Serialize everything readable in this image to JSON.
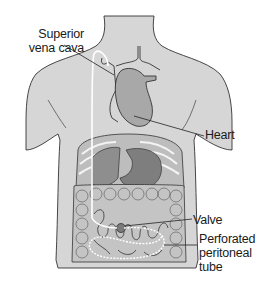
{
  "diagram": {
    "labels": {
      "superior_vena_cava": "Superior\nvena cava",
      "superior_vena_cava_line1": "Superior",
      "superior_vena_cava_line2": "vena cava",
      "heart": "Heart",
      "valve": "Valve",
      "tube_line1": "Perforated",
      "tube_line2": "peritoneal",
      "tube_line3": "tube"
    },
    "colors": {
      "background": "#ffffff",
      "body_fill": "#d6d6d6",
      "heart_fill": "#a8a8a8",
      "organ_fill": "#9a9a9a",
      "intestine_fill": "#c4c4c4",
      "outline": "#333333",
      "tube": "#ffffff",
      "valve": "#7a7a7a"
    }
  }
}
